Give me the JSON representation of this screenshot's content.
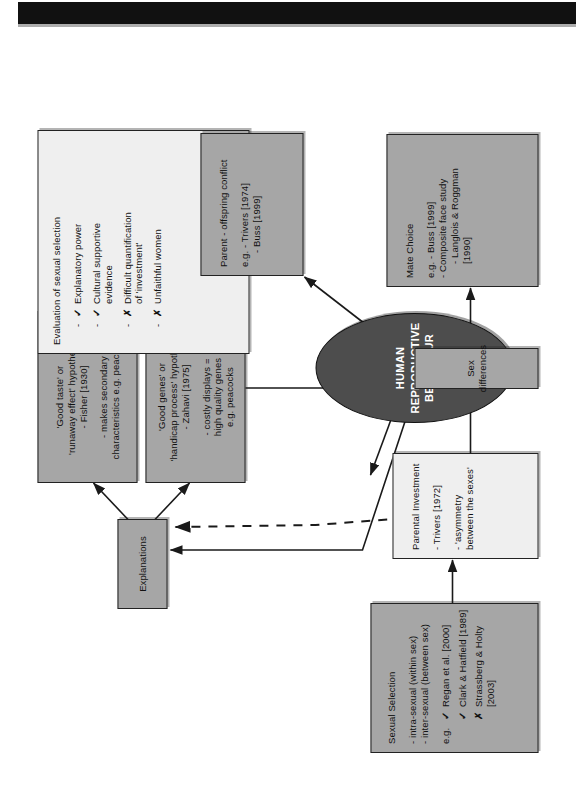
{
  "diagram": {
    "center": {
      "label_line1": "HUMAN REPRODUCTIVE",
      "label_line2": "BEHAVIOUR"
    },
    "nodes": {
      "explanations": {
        "label": "Explanations"
      },
      "good_genes": {
        "title_line1": "'Good genes' or",
        "title_line2": "'handicap process' hypothesis",
        "title_line3": "- Zahavi [1975]",
        "body_line1": "- costly displays =",
        "body_line2": "high quality genes",
        "body_line3": "e.g. peacocks"
      },
      "good_taste": {
        "title_line1": "'Good taste' or",
        "title_line2": "'runaway effect' hypothesis",
        "title_line3": "- Fisher [1930]",
        "body_line1": "- makes secondary",
        "body_line2": "characteristics e.g. peacocks"
      },
      "evaluation": {
        "title": "Evaluation of sexual selection",
        "items": [
          {
            "dash": "-",
            "mark": "✓",
            "text": "Explanatory power"
          },
          {
            "dash": "-",
            "mark": "✓",
            "text": "Cultural supportive\nevidence"
          },
          {
            "dash": "-",
            "mark": "✗",
            "text": "Difficult quantification\nof 'investment'"
          },
          {
            "dash": "-",
            "mark": "✗",
            "text": "Unfaithful women"
          }
        ]
      },
      "sexual_selection": {
        "title": "Sexual Selection",
        "body_line1": "- intra-sexual (within sex)",
        "body_line2": "- inter-sexual (between sex)",
        "items": [
          {
            "prefix": "e.g.",
            "mark": "✓",
            "text": "Regan et al. [2000]"
          },
          {
            "prefix": "",
            "mark": "✓",
            "text": "Clark & Hatfield [1989]"
          },
          {
            "prefix": "",
            "mark": "✗",
            "text": "Strassberg & Holty [2003]"
          }
        ]
      },
      "parental_investment": {
        "title": "Parental Investment",
        "body_line1": "- Trivers [1972]",
        "body_line2": "- 'asymmetry between the sexes'"
      },
      "sex_differences": {
        "label": "Sex differences"
      },
      "mate_choice": {
        "title": "Mate Choice",
        "body_line1": "e.g. - Buss [1999]",
        "body_line2": "- Composite face study",
        "body_line3": "- Langlois & Roggman [1990]"
      },
      "parent_offspring": {
        "title": "Parent - offspring conflict",
        "body_line1": "e.g. - Trivers [1974]",
        "body_line2": "- Buss [1999]"
      }
    },
    "colors": {
      "node_gray": "#a6a6a6",
      "node_light": "#efefef",
      "ellipse_fill": "#4d4d4d",
      "stroke": "#222222",
      "page_background": "#ffffff",
      "top_bar": "#111111"
    }
  }
}
